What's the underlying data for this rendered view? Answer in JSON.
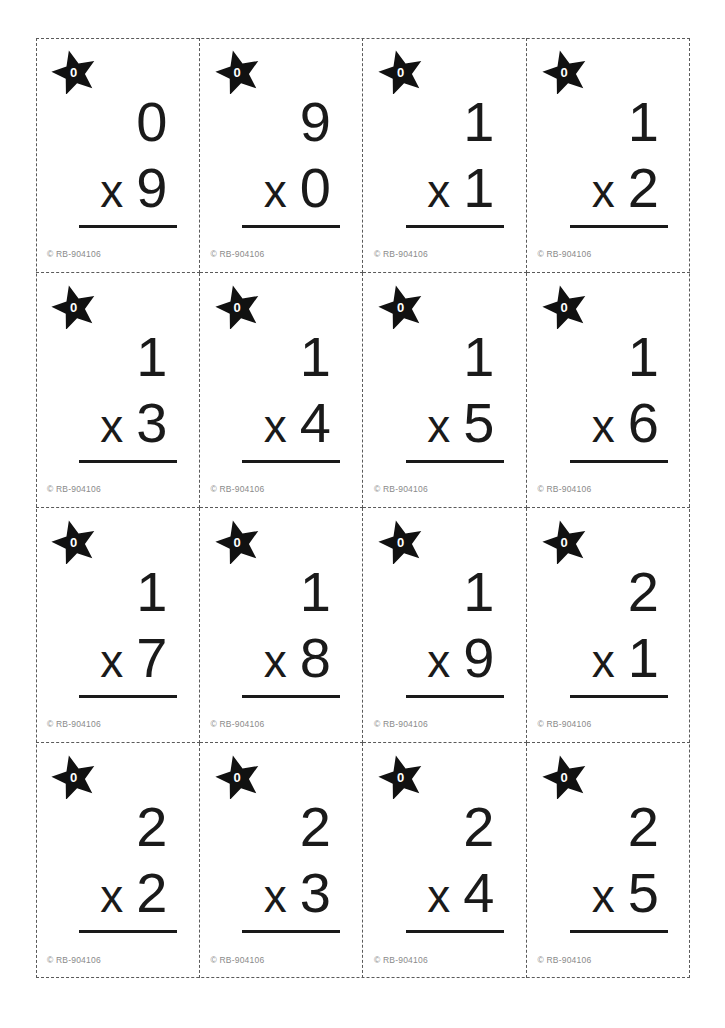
{
  "page": {
    "background_color": "#ffffff",
    "cut_line_color": "#5a5a5a",
    "ink_color": "#1a1a1a",
    "copyright_color": "#8a8a8a"
  },
  "card_defaults": {
    "copyright": "© RB-904106",
    "star_label": "0",
    "operator": "x",
    "copyright_symbol": "©"
  },
  "grid": {
    "columns": 4,
    "rows": 4,
    "total_cards": 16
  },
  "cards": [
    {
      "star": "0",
      "top": "0",
      "operator": "x",
      "bottom": "9",
      "copyright": "© RB-904106"
    },
    {
      "star": "0",
      "top": "9",
      "operator": "x",
      "bottom": "0",
      "copyright": "© RB-904106"
    },
    {
      "star": "0",
      "top": "1",
      "operator": "x",
      "bottom": "1",
      "copyright": "© RB-904106"
    },
    {
      "star": "0",
      "top": "1",
      "operator": "x",
      "bottom": "2",
      "copyright": "© RB-904106"
    },
    {
      "star": "0",
      "top": "1",
      "operator": "x",
      "bottom": "3",
      "copyright": "© RB-904106"
    },
    {
      "star": "0",
      "top": "1",
      "operator": "x",
      "bottom": "4",
      "copyright": "© RB-904106"
    },
    {
      "star": "0",
      "top": "1",
      "operator": "x",
      "bottom": "5",
      "copyright": "© RB-904106"
    },
    {
      "star": "0",
      "top": "1",
      "operator": "x",
      "bottom": "6",
      "copyright": "© RB-904106"
    },
    {
      "star": "0",
      "top": "1",
      "operator": "x",
      "bottom": "7",
      "copyright": "© RB-904106"
    },
    {
      "star": "0",
      "top": "1",
      "operator": "x",
      "bottom": "8",
      "copyright": "© RB-904106"
    },
    {
      "star": "0",
      "top": "1",
      "operator": "x",
      "bottom": "9",
      "copyright": "© RB-904106"
    },
    {
      "star": "0",
      "top": "2",
      "operator": "x",
      "bottom": "1",
      "copyright": "© RB-904106"
    },
    {
      "star": "0",
      "top": "2",
      "operator": "x",
      "bottom": "2",
      "copyright": "© RB-904106"
    },
    {
      "star": "0",
      "top": "2",
      "operator": "x",
      "bottom": "3",
      "copyright": "© RB-904106"
    },
    {
      "star": "0",
      "top": "2",
      "operator": "x",
      "bottom": "4",
      "copyright": "© RB-904106"
    },
    {
      "star": "0",
      "top": "2",
      "operator": "x",
      "bottom": "5",
      "copyright": "© RB-904106"
    }
  ]
}
